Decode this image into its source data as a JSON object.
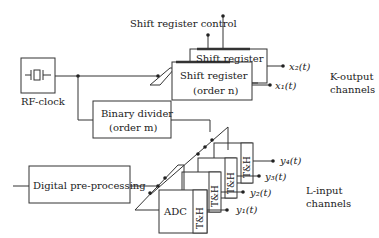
{
  "title": "Shift register control",
  "rf_clock": {
    "label": "RF-clock"
  },
  "binary_divider": {
    "line1": "Binary divider",
    "line2": "(order m)"
  },
  "shift_register_back": {
    "label": "Shift register"
  },
  "shift_register_front": {
    "line1": "Shift register",
    "line2": "(order n)"
  },
  "digital_preprocessing": {
    "label": "Digital pre-processing"
  },
  "adc": {
    "label": "ADC"
  },
  "th_label": "T&H",
  "outputs": {
    "x2": "x₂(t)",
    "x1": "x₁(t)"
  },
  "inputs": {
    "y4": "y₄(t)",
    "y3": "y₃(t)",
    "y2": "y₂(t)",
    "y1": "y₁(t)"
  },
  "k_output": {
    "line1": "K-output",
    "line2": "channels"
  },
  "l_input": {
    "line1": "L-input",
    "line2": "channels"
  },
  "colors": {
    "line": "#333333",
    "bg": "#ffffff"
  }
}
